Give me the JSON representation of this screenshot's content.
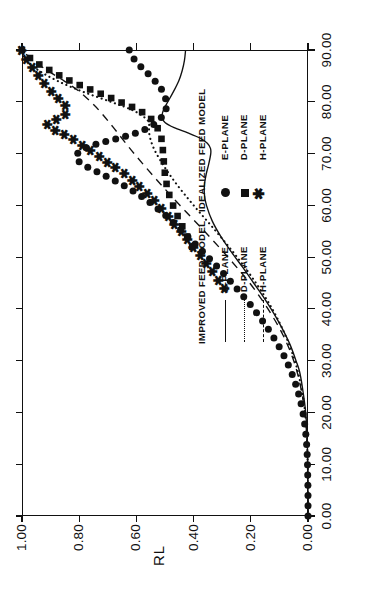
{
  "chart_data": {
    "type": "line",
    "title": "",
    "xlabel": "",
    "ylabel": "RL",
    "xlim": [
      0,
      90
    ],
    "ylim": [
      0,
      1
    ],
    "grid": false,
    "x_ticks": [
      "0.00",
      "10.00",
      "20.00",
      "30.00",
      "40.00",
      "50.00",
      "60.00",
      "70.00",
      "80.00",
      "90.00"
    ],
    "y_ticks": [
      "0.00",
      "0.20",
      "0.40",
      "0.60",
      "0.80",
      "1.00"
    ],
    "legend_position": "inside-lower-left",
    "legend_groups": [
      {
        "heading": "IMPROVED FEED MODEL",
        "entries": [
          {
            "label": "E-PLANE",
            "key": "solid-line"
          },
          {
            "label": "D-PLANE",
            "key": "dotted-line"
          },
          {
            "label": "H-PLANE",
            "key": "dashed-line"
          }
        ]
      },
      {
        "heading": "IDEALIZED FEED MODEL",
        "entries": [
          {
            "label": "E-PLANE",
            "key": "filled-circle-marker"
          },
          {
            "label": "D-PLANE",
            "key": "filled-square-marker"
          },
          {
            "label": "H-PLANE",
            "key": "asterisk-marker"
          }
        ]
      }
    ],
    "series": [
      {
        "name": "IMPROVED FEED MODEL E-PLANE",
        "style": "solid",
        "x": [
          0,
          5,
          10,
          15,
          20,
          25,
          28,
          30,
          33,
          36,
          39,
          42,
          45,
          48,
          51,
          54,
          57,
          60,
          62,
          64,
          66,
          68,
          70,
          71,
          72,
          73,
          74,
          75,
          76,
          77,
          78,
          79,
          80,
          82,
          84,
          86,
          88,
          90
        ],
        "y": [
          0.0,
          0.0,
          0.001,
          0.003,
          0.008,
          0.02,
          0.03,
          0.042,
          0.062,
          0.088,
          0.118,
          0.152,
          0.19,
          0.228,
          0.268,
          0.305,
          0.335,
          0.355,
          0.362,
          0.362,
          0.356,
          0.347,
          0.34,
          0.341,
          0.352,
          0.378,
          0.42,
          0.468,
          0.5,
          0.51,
          0.508,
          0.5,
          0.49,
          0.47,
          0.452,
          0.44,
          0.432,
          0.428
        ]
      },
      {
        "name": "IMPROVED FEED MODEL D-PLANE",
        "style": "dotted",
        "x": [
          0,
          5,
          10,
          15,
          20,
          25,
          30,
          35,
          40,
          45,
          50,
          55,
          60,
          65,
          70,
          73,
          75,
          76,
          77,
          78,
          79,
          80,
          82,
          84,
          86,
          88,
          90
        ],
        "y": [
          0.0,
          0.0,
          0.001,
          0.004,
          0.01,
          0.024,
          0.046,
          0.08,
          0.125,
          0.182,
          0.248,
          0.322,
          0.4,
          0.472,
          0.53,
          0.552,
          0.556,
          0.556,
          0.572,
          0.6,
          0.64,
          0.69,
          0.79,
          0.875,
          0.94,
          0.985,
          1.0
        ]
      },
      {
        "name": "IMPROVED FEED MODEL H-PLANE",
        "style": "dashed",
        "x": [
          0,
          5,
          10,
          15,
          20,
          25,
          30,
          35,
          40,
          45,
          50,
          55,
          60,
          65,
          70,
          75,
          78,
          80,
          82,
          84,
          86,
          88,
          90
        ],
        "y": [
          0.0,
          0.0,
          0.001,
          0.004,
          0.011,
          0.026,
          0.05,
          0.088,
          0.14,
          0.204,
          0.28,
          0.362,
          0.448,
          0.53,
          0.608,
          0.68,
          0.725,
          0.76,
          0.8,
          0.852,
          0.91,
          0.962,
          1.0
        ]
      },
      {
        "name": "IDEALIZED FEED MODEL E-PLANE",
        "style": "circles",
        "x": [
          0,
          4,
          8,
          12,
          16,
          20,
          24,
          28,
          32,
          36,
          40,
          44,
          48,
          52,
          55,
          58,
          60,
          62,
          64,
          66,
          67,
          68,
          69,
          70,
          71,
          72,
          73,
          74,
          75,
          76,
          77,
          78,
          79,
          80,
          82,
          84,
          86,
          88,
          90
        ],
        "y": [
          0.0,
          0.0,
          0.001,
          0.003,
          0.008,
          0.018,
          0.035,
          0.06,
          0.094,
          0.138,
          0.19,
          0.25,
          0.315,
          0.385,
          0.44,
          0.497,
          0.54,
          0.59,
          0.65,
          0.72,
          0.758,
          0.79,
          0.81,
          0.806,
          0.78,
          0.73,
          0.66,
          0.6,
          0.558,
          0.53,
          0.512,
          0.5,
          0.495,
          0.495,
          0.508,
          0.535,
          0.57,
          0.605,
          0.625
        ]
      },
      {
        "name": "IDEALIZED FEED MODEL D-PLANE",
        "style": "squares",
        "x": [
          52,
          56,
          60,
          63,
          66,
          69,
          72,
          74,
          76,
          77,
          78,
          79,
          80,
          81,
          82,
          84,
          86,
          88,
          90
        ],
        "y": [
          0.405,
          0.44,
          0.472,
          0.49,
          0.5,
          0.505,
          0.51,
          0.518,
          0.538,
          0.555,
          0.58,
          0.615,
          0.658,
          0.7,
          0.745,
          0.83,
          0.9,
          0.962,
          1.0
        ]
      },
      {
        "name": "IDEALIZED FEED MODEL H-PLANE",
        "style": "asterisks",
        "x": [
          44,
          48,
          52,
          55,
          58,
          60,
          62,
          64,
          66,
          68,
          70,
          71,
          72,
          73,
          74,
          75,
          76,
          77,
          78,
          79,
          80,
          82,
          84,
          86,
          88,
          90
        ],
        "y": [
          0.29,
          0.345,
          0.4,
          0.445,
          0.49,
          0.52,
          0.555,
          0.595,
          0.64,
          0.69,
          0.742,
          0.77,
          0.8,
          0.83,
          0.862,
          0.9,
          0.905,
          0.86,
          0.84,
          0.845,
          0.86,
          0.895,
          0.925,
          0.955,
          0.982,
          1.0
        ]
      }
    ]
  }
}
